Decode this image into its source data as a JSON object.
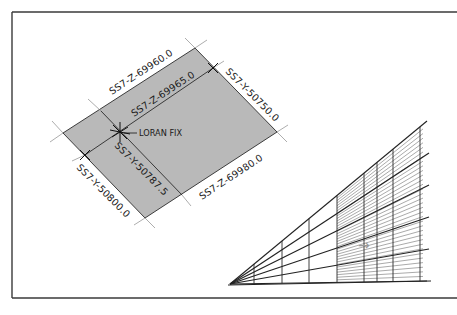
{
  "figure": {
    "colors": {
      "background": "#ffffff",
      "frame": "#3a3a3a",
      "shade": "#b9b9b9",
      "line": "#2a2a2a",
      "guide": "#8a8a8a",
      "arrow": "#9a9a9a"
    },
    "loran_diagram": {
      "labels": {
        "z_outer_top": "SS7-Z-69960.0",
        "z_inner_top": "SS7-Z-69965.0",
        "z_bottom": "SS7-Z-69980.0",
        "y_right": "SS7-Y-50750.0",
        "y_middle": "SS7-Y-50787.5",
        "y_left": "SS7-Y-50800.0",
        "fix": "LORAN FIX"
      }
    },
    "perspective_grid": {
      "apex": [
        230,
        284
      ],
      "right_x": 427,
      "heavy_line_end_y": [
        121,
        153,
        185,
        217,
        249,
        281
      ],
      "vertical_x": [
        254,
        282,
        309,
        337,
        364,
        377,
        393,
        420
      ],
      "hatch_start_x": 337,
      "hatch_count": 34,
      "arrow_glyph": "→"
    }
  }
}
